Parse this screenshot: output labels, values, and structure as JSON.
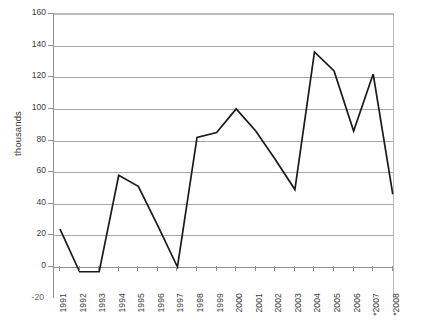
{
  "chart_data": {
    "type": "line",
    "title": "",
    "xlabel": "",
    "ylabel": "thousands",
    "categories": [
      "1991",
      "1992",
      "1993",
      "1994",
      "1995",
      "1996",
      "1997",
      "1998",
      "1999",
      "2000",
      "2001",
      "2002",
      "2003",
      "2004",
      "2005",
      "2006",
      "*2007",
      "*2008"
    ],
    "values": [
      24,
      -3,
      -3,
      58,
      51,
      26,
      0,
      82,
      85,
      100,
      86,
      68,
      49,
      136,
      124,
      86,
      122,
      46
    ],
    "series": [
      {
        "name": "thousands",
        "values": [
          24,
          -3,
          -3,
          58,
          51,
          26,
          0,
          82,
          85,
          100,
          86,
          68,
          49,
          136,
          124,
          86,
          122,
          46
        ]
      }
    ],
    "ylim": [
      -20,
      160
    ],
    "yticks": [
      160,
      140,
      120,
      100,
      80,
      60,
      40,
      20,
      0,
      -20
    ],
    "ytick_labels": [
      "160",
      "140",
      "120",
      "100",
      "80",
      "60",
      "40",
      "20",
      "0",
      "-20"
    ],
    "xlim": [
      "1991",
      "*2008"
    ],
    "grid": true,
    "legend": "none",
    "line_color": "#1a1a1a",
    "grid_color": "#a8a8a8",
    "axis_color": "#8f8f8f",
    "background": "#ffffff",
    "annotations": [
      "* denotes projected or provisional years 2007 and 2008"
    ]
  },
  "axis": {
    "y_title": "thousands",
    "y_labels": [
      "160",
      "140",
      "120",
      "100",
      "80",
      "60",
      "40",
      "20",
      "0"
    ],
    "y_label_bottom": "-20",
    "x_labels": [
      "1991",
      "1992",
      "1993",
      "1994",
      "1995",
      "1996",
      "1997",
      "1998",
      "1999",
      "2000",
      "2001",
      "2002",
      "2003",
      "2004",
      "2005",
      "2006",
      "*2007",
      "*2008"
    ]
  }
}
